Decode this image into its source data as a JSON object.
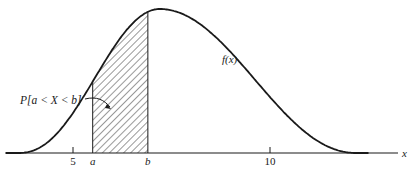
{
  "diagram": {
    "type": "probability-density-plot",
    "curve_label": "f(x)",
    "axis_label": "x",
    "ticks": [
      {
        "value": 5,
        "label": "5"
      },
      {
        "value": 10,
        "label": "10"
      }
    ],
    "bounds": [
      {
        "name": "a",
        "label": "a",
        "value": 5.5
      },
      {
        "name": "b",
        "label": "b",
        "value": 6.9
      }
    ],
    "shaded_region_label": "P[a < X < b]",
    "curve": {
      "start": 3.6,
      "mode": 7.2,
      "end": 12.2
    },
    "colors": {
      "line": "#1a1a1a",
      "hatch": "#333333",
      "background": "#ffffff"
    }
  }
}
